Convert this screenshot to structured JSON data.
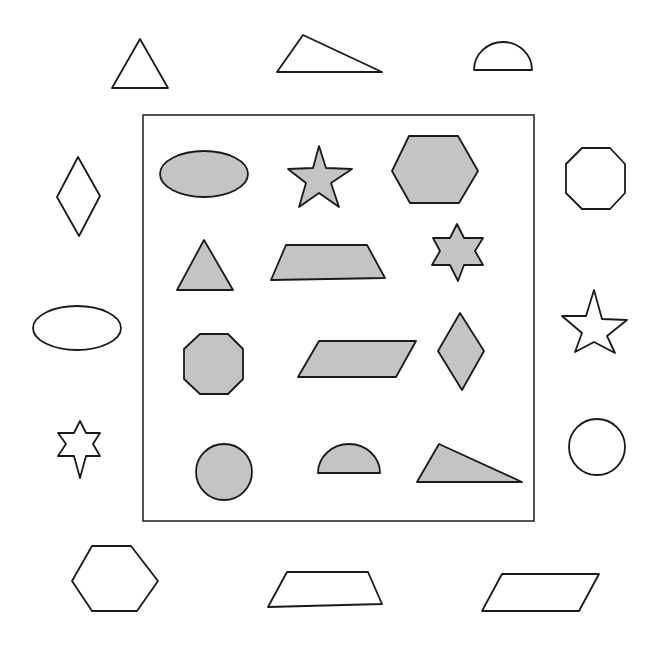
{
  "diagram": {
    "colors": {
      "fill": "#c4c4c4",
      "stroke": "#1a1a1a",
      "background": "#ffffff"
    },
    "inner_shapes": [
      {
        "name": "ellipse",
        "row": 1,
        "col": 1
      },
      {
        "name": "five-point-star",
        "row": 1,
        "col": 2
      },
      {
        "name": "hexagon",
        "row": 1,
        "col": 3
      },
      {
        "name": "equilateral-triangle",
        "row": 2,
        "col": 1
      },
      {
        "name": "trapezoid",
        "row": 2,
        "col": 2
      },
      {
        "name": "six-point-star",
        "row": 2,
        "col": 3
      },
      {
        "name": "octagon",
        "row": 3,
        "col": 1
      },
      {
        "name": "parallelogram",
        "row": 3,
        "col": 2
      },
      {
        "name": "rhombus",
        "row": 3,
        "col": 3
      },
      {
        "name": "circle",
        "row": 4,
        "col": 1
      },
      {
        "name": "semicircle",
        "row": 4,
        "col": 2
      },
      {
        "name": "right-triangle",
        "row": 4,
        "col": 3
      }
    ],
    "outer_shapes": {
      "top": [
        "equilateral-triangle",
        "scalene-triangle",
        "semicircle"
      ],
      "left": [
        "rhombus",
        "ellipse",
        "six-point-star"
      ],
      "right": [
        "octagon",
        "five-point-star",
        "circle"
      ],
      "bottom": [
        "hexagon",
        "trapezoid",
        "parallelogram"
      ]
    }
  }
}
